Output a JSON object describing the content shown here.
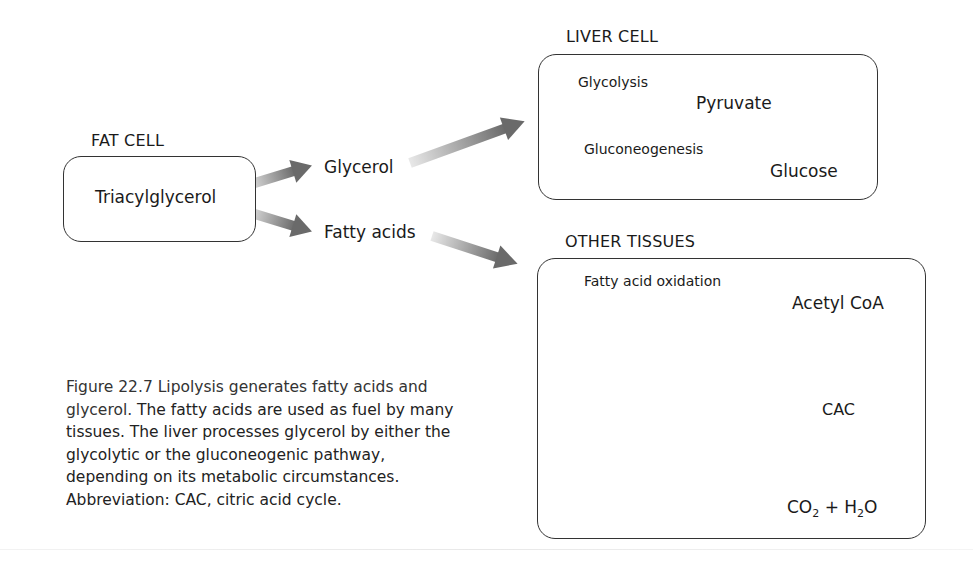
{
  "fat_cell": {
    "heading": "FAT CELL",
    "content": "Triacylglycerol"
  },
  "products": {
    "glycerol": "Glycerol",
    "fatty_acids": "Fatty acids"
  },
  "liver_cell": {
    "heading": "LIVER CELL",
    "pathways": [
      {
        "process": "Glycolysis",
        "product": "Pyruvate"
      },
      {
        "process": "Gluconeogenesis",
        "product": "Glucose"
      }
    ]
  },
  "other_tissues": {
    "heading": "OTHER TISSUES",
    "process": "Fatty acid oxidation",
    "product": "Acetyl CoA",
    "cycle": "CAC",
    "final_products": {
      "co": "CO",
      "sub1": "2",
      "plus": " + H",
      "sub2": "2",
      "o": "O"
    }
  },
  "caption": {
    "title": "Figure 22.7  Lipolysis generates fatty acids and glycerol.",
    "body": " The fatty acids are used as fuel by many tissues. The liver processes glycerol by either the glycolytic or the gluconeogenic pathway, depending on its metabolic circumstances. Abbreviation: CAC, citric acid cycle."
  },
  "colors": {
    "arrow_dark": "#6e6e6e",
    "arrow_light": "#e6e6e6",
    "box_border": "#333333"
  }
}
